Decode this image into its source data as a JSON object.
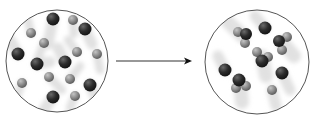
{
  "diagram": {
    "type": "particle-reaction",
    "colors": {
      "background": "#ffffff",
      "circle_stroke": "#555555",
      "dark_atom": "#2a2a2a",
      "light_atom": "#8a8a8a",
      "arrow": "#333333",
      "motion_trail": "#dcdcdc"
    },
    "before": {
      "label": "before",
      "circle": {
        "cx": 57,
        "cy": 61,
        "r": 51
      },
      "particles": [
        {
          "kind": "dark",
          "x": 53,
          "y": 19,
          "r": 6.5,
          "trail": [
            48,
            44
          ]
        },
        {
          "kind": "light",
          "x": 73,
          "y": 20,
          "r": 5,
          "trail": [
            74,
            34
          ]
        },
        {
          "kind": "dark",
          "x": 85,
          "y": 29,
          "r": 6.5,
          "trail": [
            92,
            44
          ]
        },
        {
          "kind": "light",
          "x": 31,
          "y": 33,
          "r": 5,
          "trail": [
            28,
            20
          ]
        },
        {
          "kind": "light",
          "x": 44,
          "y": 43,
          "r": 5,
          "trail": [
            38,
            58
          ]
        },
        {
          "kind": "dark",
          "x": 18,
          "y": 54,
          "r": 6.5,
          "trail": [
            10,
            40
          ]
        },
        {
          "kind": "light",
          "x": 77,
          "y": 52,
          "r": 5,
          "trail": [
            68,
            40
          ]
        },
        {
          "kind": "light",
          "x": 97,
          "y": 54,
          "r": 5,
          "trail": [
            100,
            70
          ]
        },
        {
          "kind": "dark",
          "x": 37,
          "y": 64,
          "r": 6.5,
          "trail": [
            50,
            62
          ]
        },
        {
          "kind": "dark",
          "x": 65,
          "y": 62,
          "r": 6.5,
          "trail": [
            58,
            48
          ]
        },
        {
          "kind": "light",
          "x": 49,
          "y": 77,
          "r": 5,
          "trail": [
            62,
            90
          ]
        },
        {
          "kind": "light",
          "x": 70,
          "y": 79,
          "r": 5,
          "trail": [
            80,
            66
          ]
        },
        {
          "kind": "light",
          "x": 22,
          "y": 83,
          "r": 5,
          "trail": [
            16,
            98
          ]
        },
        {
          "kind": "dark",
          "x": 90,
          "y": 85,
          "r": 6.5,
          "trail": [
            96,
            98
          ]
        },
        {
          "kind": "dark",
          "x": 53,
          "y": 97,
          "r": 6.5,
          "trail": [
            44,
            110
          ]
        },
        {
          "kind": "light",
          "x": 75,
          "y": 96,
          "r": 5,
          "trail": [
            70,
            108
          ]
        }
      ]
    },
    "arrow": {
      "x1": 116,
      "y1": 61,
      "x2": 192,
      "y2": 61,
      "direction": "right"
    },
    "after": {
      "label": "after",
      "circle": {
        "cx": 257,
        "cy": 62,
        "r": 52
      },
      "molecules": [
        {
          "atoms": [
            {
              "kind": "light",
              "x": 238,
              "y": 32,
              "r": 5
            },
            {
              "kind": "dark",
              "x": 246,
              "y": 34,
              "r": 6
            },
            {
              "kind": "light",
              "x": 245,
              "y": 43,
              "r": 5
            }
          ],
          "trail": [
            228,
            22
          ]
        },
        {
          "atoms": [
            {
              "kind": "dark",
              "x": 265,
              "y": 28,
              "r": 6.5
            }
          ],
          "trail": [
            255,
            16
          ]
        },
        {
          "atoms": [
            {
              "kind": "dark",
              "x": 279,
              "y": 41,
              "r": 6
            },
            {
              "kind": "light",
              "x": 287,
              "y": 37,
              "r": 5
            },
            {
              "kind": "light",
              "x": 282,
              "y": 50,
              "r": 5
            }
          ],
          "trail": [
            294,
            56
          ]
        },
        {
          "atoms": [
            {
              "kind": "light",
              "x": 257,
              "y": 52,
              "r": 5
            },
            {
              "kind": "light",
              "x": 268,
              "y": 57,
              "r": 5
            },
            {
              "kind": "dark",
              "x": 262,
              "y": 61,
              "r": 6.5
            }
          ],
          "trail": [
            266,
            76
          ]
        },
        {
          "atoms": [
            {
              "kind": "dark",
              "x": 225,
              "y": 70,
              "r": 6.5
            }
          ],
          "trail": [
            218,
            56
          ]
        },
        {
          "atoms": [
            {
              "kind": "dark",
              "x": 282,
              "y": 73,
              "r": 6.5
            }
          ],
          "trail": [
            290,
            90
          ]
        },
        {
          "atoms": [
            {
              "kind": "light",
              "x": 236,
              "y": 88,
              "r": 5
            },
            {
              "kind": "dark",
              "x": 239,
              "y": 80,
              "r": 6.5
            },
            {
              "kind": "light",
              "x": 246,
              "y": 86,
              "r": 5
            }
          ],
          "trail": [
            242,
            102
          ]
        },
        {
          "atoms": [
            {
              "kind": "light",
              "x": 272,
              "y": 90,
              "r": 5
            }
          ],
          "trail": [
            276,
            106
          ]
        }
      ]
    }
  }
}
